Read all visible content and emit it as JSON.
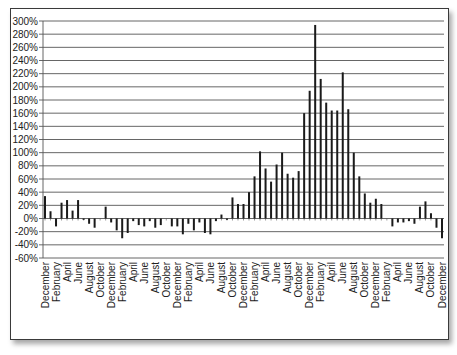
{
  "chart_data": {
    "type": "bar",
    "title": "",
    "xlabel": "",
    "ylabel": "",
    "ylim": [
      -60,
      300
    ],
    "yticks": [
      300,
      280,
      260,
      240,
      220,
      200,
      180,
      160,
      140,
      120,
      100,
      80,
      60,
      40,
      20,
      0,
      -20,
      -40,
      -60
    ],
    "ytick_labels": [
      "300%",
      "280%",
      "260%",
      "240%",
      "220%",
      "200%",
      "180%",
      "160%",
      "140%",
      "120%",
      "100%",
      "80%",
      "60%",
      "40%",
      "20%",
      "0%",
      "-20%",
      "-40%",
      "-60%"
    ],
    "grid": true,
    "legend": "none",
    "x_tick_labels": [
      "December",
      "February",
      "April",
      "June",
      "August",
      "October",
      "December",
      "February",
      "April",
      "June",
      "August",
      "October",
      "December",
      "February",
      "April",
      "June",
      "August",
      "October",
      "December",
      "February",
      "April",
      "June",
      "August",
      "October",
      "December",
      "February",
      "April",
      "June",
      "August",
      "October",
      "December",
      "February",
      "April",
      "June",
      "August",
      "October",
      "December"
    ],
    "categories": [
      "Dec",
      "Jan",
      "Feb",
      "Mar",
      "Apr",
      "May",
      "Jun",
      "Jul",
      "Aug",
      "Sep",
      "Oct",
      "Nov",
      "Dec",
      "Jan",
      "Feb",
      "Mar",
      "Apr",
      "May",
      "Jun",
      "Jul",
      "Aug",
      "Sep",
      "Oct",
      "Nov",
      "Dec",
      "Jan",
      "Feb",
      "Mar",
      "Apr",
      "May",
      "Jun",
      "Jul",
      "Aug",
      "Sep",
      "Oct",
      "Nov",
      "Dec",
      "Jan",
      "Feb",
      "Mar",
      "Apr",
      "May",
      "Jun",
      "Jul",
      "Aug",
      "Sep",
      "Oct",
      "Nov",
      "Dec",
      "Jan",
      "Feb",
      "Mar",
      "Apr",
      "May",
      "Jun",
      "Jul",
      "Aug",
      "Sep",
      "Oct",
      "Nov",
      "Dec",
      "Jan",
      "Feb",
      "Mar",
      "Apr",
      "May",
      "Jun",
      "Jul",
      "Aug",
      "Sep",
      "Oct",
      "Nov",
      "Dec"
    ],
    "values": [
      34,
      11,
      -12,
      24,
      28,
      12,
      28,
      -2,
      -8,
      -14,
      0,
      18,
      -6,
      -18,
      -30,
      -22,
      -4,
      -10,
      -12,
      -4,
      -14,
      -10,
      0,
      -12,
      -12,
      -24,
      -8,
      -18,
      -6,
      -22,
      -24,
      -4,
      6,
      -2,
      32,
      22,
      22,
      40,
      64,
      102,
      76,
      56,
      82,
      100,
      68,
      62,
      72,
      160,
      194,
      294,
      212,
      176,
      164,
      164,
      222,
      166,
      100,
      64,
      38,
      24,
      30,
      22,
      0,
      -12,
      -6,
      -6,
      -4,
      -8,
      18,
      26,
      8,
      -14,
      -30
    ],
    "value_note": "Monthly values (%) estimated from gridlines; 0 marks months with no visible bar."
  }
}
